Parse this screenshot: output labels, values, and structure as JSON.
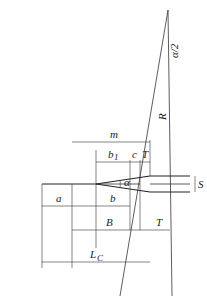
{
  "diagram": {
    "type": "railway-turnout-frog-geometry",
    "orientation": "rotated-90",
    "colors": {
      "line": "#333333",
      "background": "#ffffff",
      "text": "#222222"
    },
    "labels": {
      "a": "a",
      "b": "b",
      "b1": "b",
      "b1_sub": "1",
      "c": "c",
      "T_top": "T",
      "T_bottom": "T",
      "m": "m",
      "B": "B",
      "Lc": "L",
      "Lc_sub": "C",
      "R": "R",
      "S": "S",
      "alpha": "α",
      "alpha_half": "α/2"
    }
  }
}
